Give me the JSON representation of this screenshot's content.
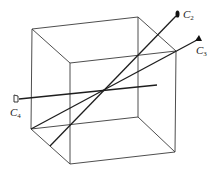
{
  "diagram": {
    "type": "cube-with-rays",
    "cube": {
      "back_face": {
        "tl": [
          32,
          29
        ],
        "tr": [
          138,
          17
        ],
        "br": [
          138,
          117
        ],
        "bl": [
          31,
          129
        ]
      },
      "front_face": {
        "tl": [
          70,
          63
        ],
        "tr": [
          176,
          51
        ],
        "br": [
          175,
          152
        ],
        "bl": [
          70,
          164
        ]
      }
    },
    "rays": [
      {
        "id": "C2",
        "label": "C",
        "subscript": "2",
        "from": [
          50,
          146
        ],
        "to": [
          177,
          14
        ],
        "marker": "ellipse"
      },
      {
        "id": "C3",
        "label": "C",
        "subscript": "3",
        "from": [
          31,
          129
        ],
        "to": [
          199,
          38
        ],
        "marker": "triangle"
      },
      {
        "id": "C4",
        "label": "C",
        "subscript": "4",
        "from": [
          15,
          99
        ],
        "to": [
          157,
          85
        ],
        "marker": "square"
      }
    ],
    "labels": {
      "c2": {
        "main": "C",
        "sub": "2"
      },
      "c3": {
        "main": "C",
        "sub": "3"
      },
      "c4": {
        "main": "C",
        "sub": "4"
      }
    },
    "colors": {
      "line": "#1e1e1e",
      "background": "#ffffff"
    }
  }
}
